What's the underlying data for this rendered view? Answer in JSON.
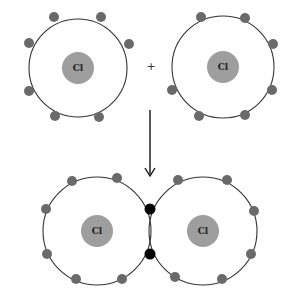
{
  "diagram": {
    "title": "",
    "colors": {
      "nucleus": "#9e9e9e",
      "electron": "#6a6a6a",
      "bond_electron": "#000000",
      "shell": "#333333"
    },
    "reactants": [
      {
        "element": "Cl",
        "valence_electrons": 7
      },
      {
        "element": "Cl",
        "valence_electrons": 7
      }
    ],
    "operator": "+",
    "arrow": "down",
    "product": {
      "atoms": [
        {
          "element": "Cl"
        },
        {
          "element": "Cl"
        }
      ],
      "shared_electrons": 2,
      "nonbonding_electrons_per_atom": 6
    },
    "labels": {
      "atom1": "Cl",
      "atom2": "Cl",
      "plus": "+",
      "product_atom1": "Cl",
      "product_atom2": "Cl"
    }
  }
}
